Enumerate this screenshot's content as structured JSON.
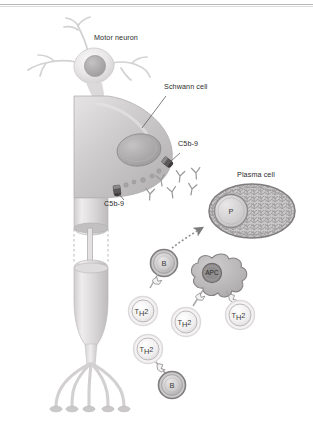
{
  "figure": {
    "width": 313,
    "height": 421,
    "background": "#ffffff",
    "top_rule_color": "#b9b9b9"
  },
  "labels": [
    {
      "id": "motor-neuron",
      "text": "Motor neuron",
      "x": 94,
      "y": 39
    },
    {
      "id": "schwann-cell",
      "text": "Schwann cell",
      "x": 164,
      "y": 88
    },
    {
      "id": "c5b9-upper",
      "text": "C5b-9",
      "x": 180,
      "y": 144
    },
    {
      "id": "c5b9-lower",
      "text": "C5b-9",
      "x": 108,
      "y": 203
    },
    {
      "id": "plasma-cell",
      "text": "Plasma cell",
      "x": 240,
      "y": 176
    }
  ],
  "cells": [
    {
      "id": "plasma-cell-body",
      "label": "P",
      "sub": "",
      "cx": 250,
      "cy": 211,
      "r": 0,
      "kind": "plasma"
    },
    {
      "id": "b-cell-upper",
      "label": "B",
      "sub": "",
      "cx": 164,
      "cy": 263,
      "r": 13,
      "kind": "b"
    },
    {
      "id": "apc-cell",
      "label": "APC",
      "sub": "",
      "cx": 212,
      "cy": 275,
      "r": 14,
      "kind": "apc"
    },
    {
      "id": "th2-cell-1",
      "label": "T",
      "sub": "H2",
      "cx": 143,
      "cy": 311,
      "r": 14,
      "kind": "th2"
    },
    {
      "id": "th2-cell-2",
      "label": "T",
      "sub": "H2",
      "cx": 186,
      "cy": 322,
      "r": 14,
      "kind": "th2"
    },
    {
      "id": "th2-cell-3",
      "label": "T",
      "sub": "H2",
      "cx": 240,
      "cy": 315,
      "r": 14,
      "kind": "th2"
    },
    {
      "id": "th2-cell-4",
      "label": "T",
      "sub": "H2",
      "cx": 148,
      "cy": 349,
      "r": 14,
      "kind": "th2"
    },
    {
      "id": "b-cell-lower",
      "label": "B",
      "sub": "",
      "cx": 172,
      "cy": 385,
      "r": 13,
      "kind": "b"
    }
  ],
  "colors": {
    "neuron_fill_light": "#eceaea",
    "neuron_fill_mid": "#d8d6d6",
    "axon_fill": "#cfcdcd",
    "schwann_fill": "#c6c4c4",
    "nucleus_fill": "#a9a7a7",
    "c5b9_pore": "#4a4a4a",
    "antibody_stroke": "#9a9a9a",
    "plasma_cytoplasm": "#bdbbbb",
    "plasma_nucleus": "#d4d2d2",
    "b_cell_fill": "#d9d7d7",
    "b_cell_ring": "#8e8c8c",
    "th2_fill": "#f1efef",
    "th2_ring": "#d6d4d4",
    "apc_fill": "#b9b7b7",
    "apc_nucleus": "#8d8b8b",
    "label_text": "#2b2b2b",
    "leader_line": "#555555"
  },
  "annotations": {
    "antibody_count": 6,
    "c5b9_pore_count": 2,
    "terminal_branch_count": 5,
    "differentiation_arrow": "B cell differentiates into plasma cell",
    "node_of_ranvier": true
  }
}
